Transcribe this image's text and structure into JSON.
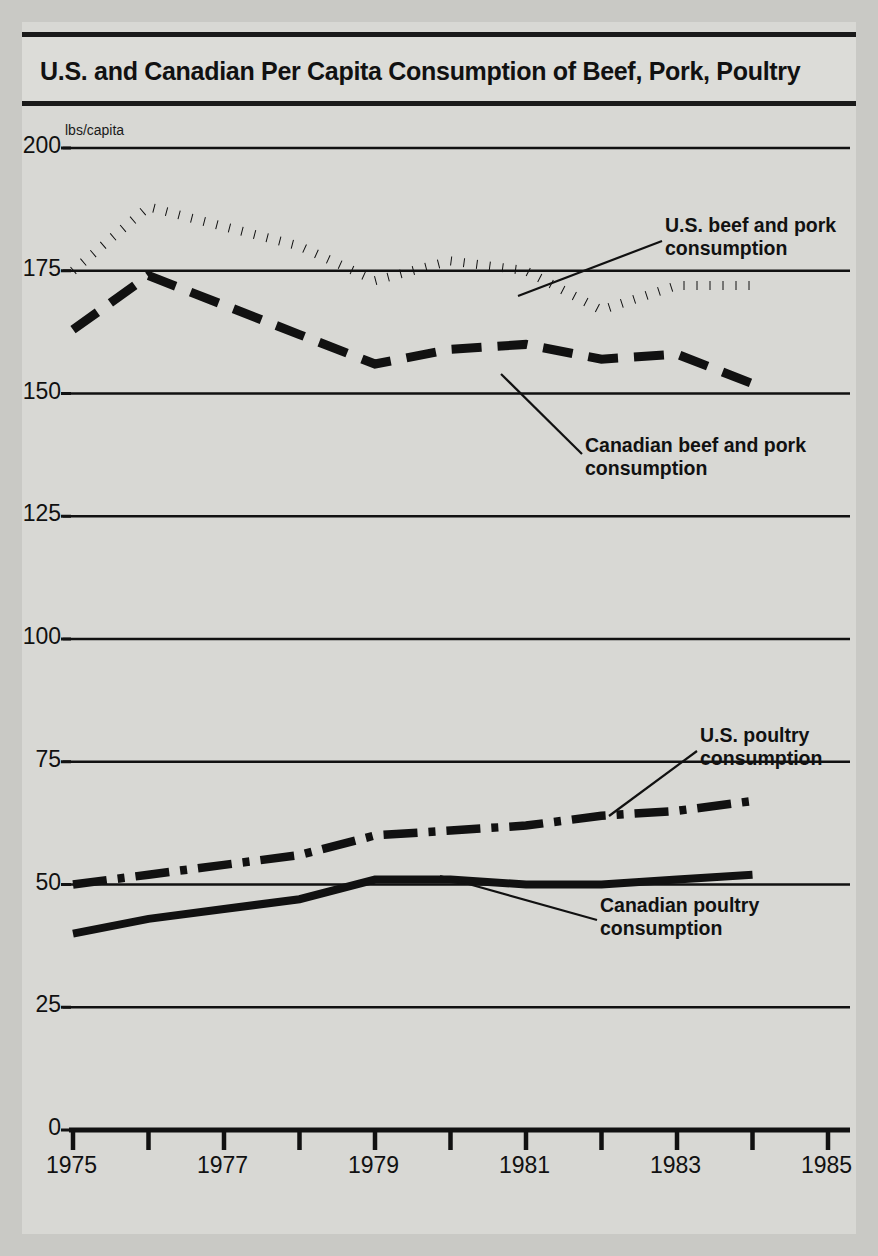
{
  "figure": {
    "title": "U.S. and Canadian Per Capita Consumption of Beef, Pork, Poultry",
    "unit_label": "lbs/capita",
    "background_color": "#d8d8d4",
    "ink_color": "#111111"
  },
  "annotations": {
    "us_beef_pork": {
      "line1": "U.S. beef and pork",
      "line2": "consumption"
    },
    "canadian_beef_pork": {
      "line1": "Canadian beef and pork",
      "line2": "consumption"
    },
    "us_poultry": {
      "line1": "U.S. poultry",
      "line2": "consumption"
    },
    "canadian_poultry": {
      "line1": "Canadian poultry",
      "line2": "consumption"
    }
  },
  "chart_data": {
    "type": "line",
    "title": "U.S. and Canadian Per Capita Consumption of Beef, Pork, Poultry",
    "xlabel": "",
    "ylabel": "lbs/capita",
    "xlim": [
      1975,
      1985
    ],
    "ylim": [
      0,
      200
    ],
    "ytick_labels": [
      "0",
      "25",
      "50",
      "75",
      "100",
      "125",
      "150",
      "175",
      "200"
    ],
    "yticks": [
      0,
      25,
      50,
      75,
      100,
      125,
      150,
      175,
      200
    ],
    "xticks": [
      1975,
      1976,
      1977,
      1978,
      1979,
      1980,
      1981,
      1982,
      1983,
      1984,
      1985
    ],
    "xtick_labels": [
      "1975",
      "",
      "1977",
      "",
      "1979",
      "",
      "1981",
      "",
      "1983",
      "",
      "1985"
    ],
    "grid": "horizontal",
    "legend": "annotated-callouts",
    "x": [
      1975,
      1976,
      1977,
      1978,
      1979,
      1980,
      1981,
      1982,
      1983,
      1984
    ],
    "series": [
      {
        "name": "U.S. beef and pork consumption",
        "style": "dotted",
        "values": [
          175,
          188,
          184,
          180,
          173,
          177,
          175,
          167,
          172,
          172
        ]
      },
      {
        "name": "Canadian beef and pork consumption",
        "style": "dashed",
        "values": [
          163,
          174,
          168,
          162,
          156,
          159,
          160,
          157,
          158,
          152
        ]
      },
      {
        "name": "U.S. poultry consumption",
        "style": "dash-dot",
        "values": [
          50,
          52,
          54,
          56,
          60,
          61,
          62,
          64,
          65,
          67
        ]
      },
      {
        "name": "Canadian poultry consumption",
        "style": "solid",
        "values": [
          40,
          43,
          45,
          47,
          51,
          51,
          50,
          50,
          51,
          52
        ]
      }
    ]
  }
}
